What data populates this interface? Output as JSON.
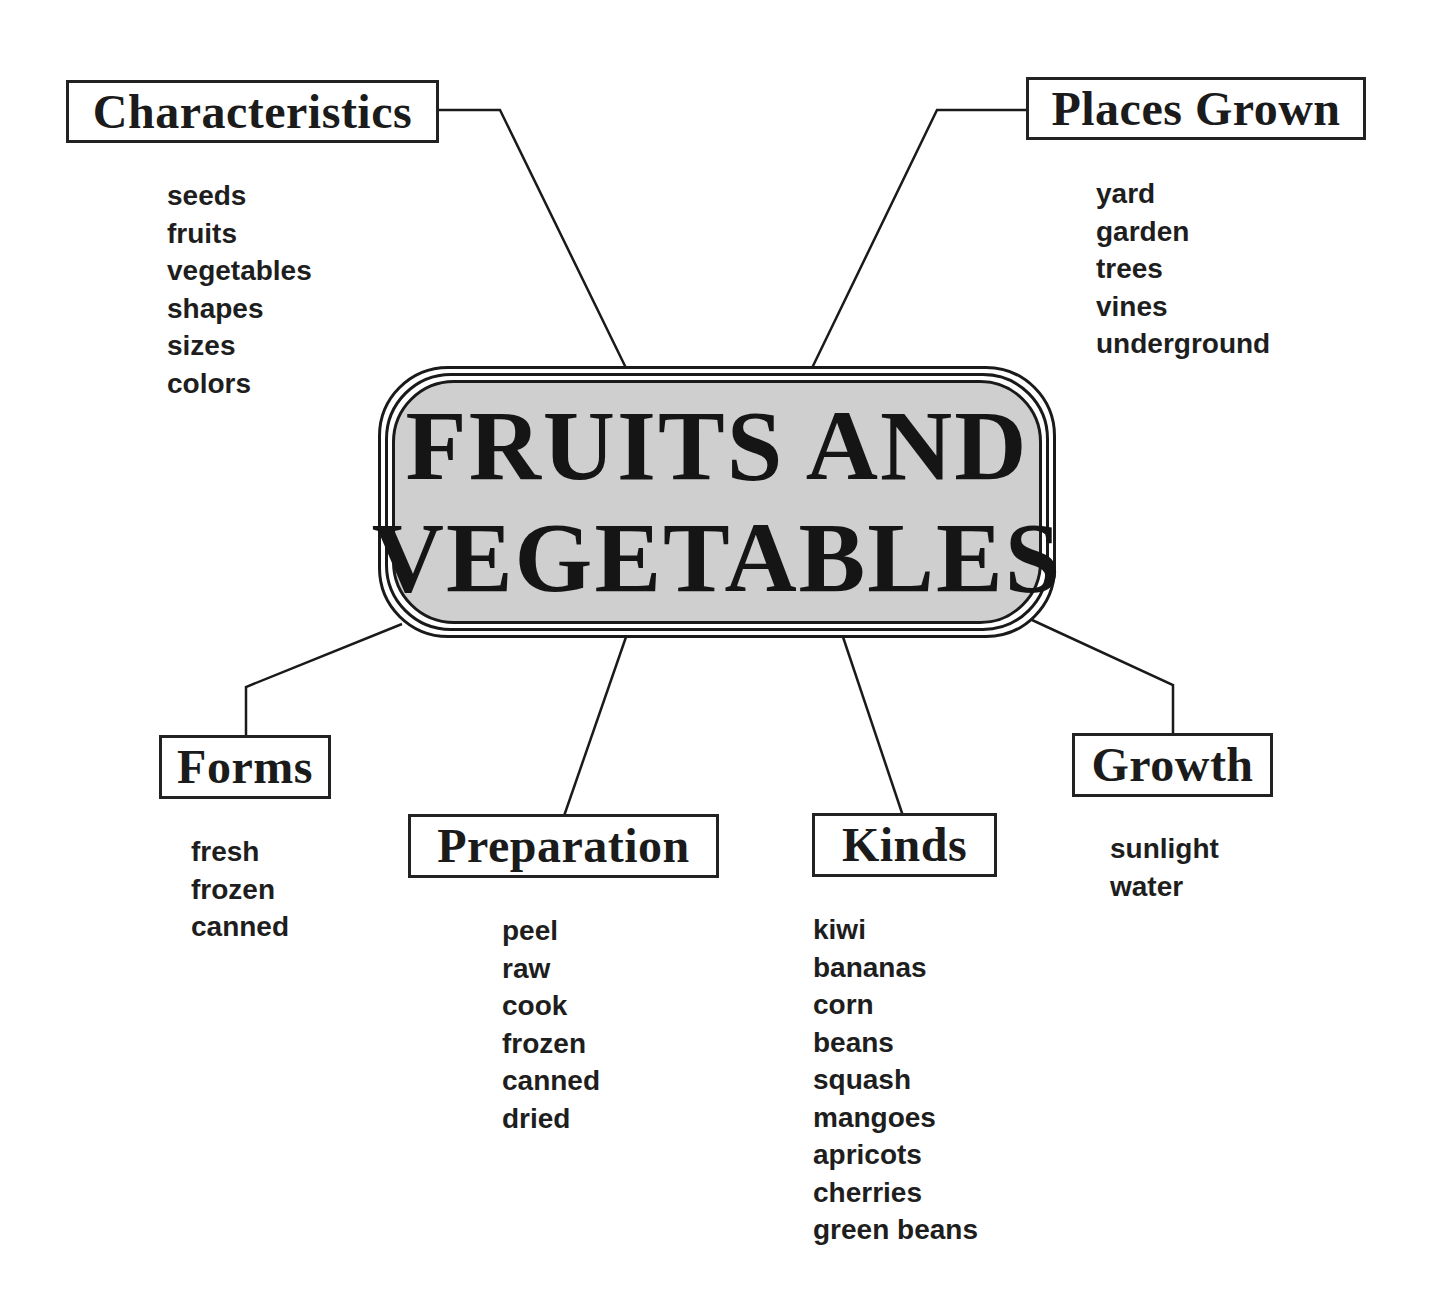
{
  "title": {
    "line1": "FRUITS AND",
    "line2": "VEGETABLES"
  },
  "colors": {
    "center_fill": "#cfcfcf",
    "stroke": "#1a1a1a",
    "text": "#1e1e1e",
    "background": "#ffffff"
  },
  "branches": {
    "characteristics": {
      "label": "Characteristics",
      "items": [
        "seeds",
        "fruits",
        "vegetables",
        "shapes",
        "sizes",
        "colors"
      ]
    },
    "places_grown": {
      "label": "Places Grown",
      "items": [
        "yard",
        "garden",
        "trees",
        "vines",
        "underground"
      ]
    },
    "forms": {
      "label": "Forms",
      "items": [
        "fresh",
        "frozen",
        "canned"
      ]
    },
    "preparation": {
      "label": "Preparation",
      "items": [
        "peel",
        "raw",
        "cook",
        "frozen",
        "canned",
        "dried"
      ]
    },
    "kinds": {
      "label": "Kinds",
      "items": [
        "kiwi",
        "bananas",
        "corn",
        "beans",
        "squash",
        "mangoes",
        "apricots",
        "cherries",
        "green beans"
      ]
    },
    "growth": {
      "label": "Growth",
      "items": [
        "sunlight",
        "water"
      ]
    }
  }
}
